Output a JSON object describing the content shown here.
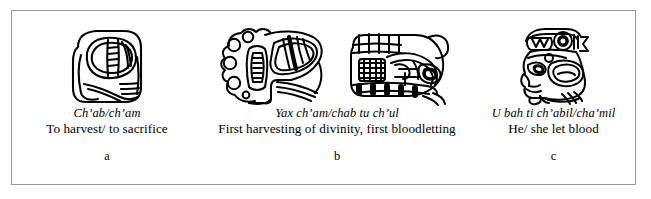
{
  "figure": {
    "border_color": "#9a9a9a",
    "background_color": "#ffffff",
    "ink_color": "#000000",
    "panels": [
      {
        "letter": "a",
        "maya_transcription": "Ch’ab/ch’am",
        "english_gloss": "To harvest/ to sacrifice",
        "glyph_blocks": [
          "maya-glyph-chab-cham"
        ],
        "glyph_count": 1
      },
      {
        "letter": "b",
        "maya_transcription": "Yax ch’am/chab tu ch’ul",
        "english_gloss": "First harvesting of divinity, first bloodletting",
        "glyph_blocks": [
          "maya-glyph-yax-cham-chab",
          "maya-glyph-tu-chul"
        ],
        "glyph_count": 2
      },
      {
        "letter": "c",
        "maya_transcription": "U bah ti ch’abil/cha’mil",
        "english_gloss": "He/ she let blood",
        "glyph_blocks": [
          "maya-glyph-u-bah-ti-chabil"
        ],
        "glyph_count": 1
      }
    ]
  }
}
